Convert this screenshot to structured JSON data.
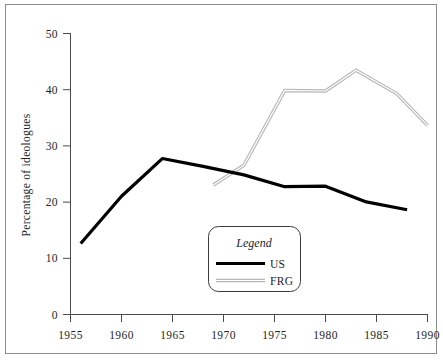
{
  "figure": {
    "border_color": "#8d8d8d",
    "background": "#ffffff"
  },
  "axes": {
    "y_axis_title": "Percentage of ideologues",
    "y_ticks": [
      "0",
      "10",
      "20",
      "30",
      "40",
      "50"
    ],
    "x_ticks": [
      "1955",
      "1960",
      "1965",
      "1970",
      "1975",
      "1980",
      "1985",
      "1990"
    ],
    "axis_color": "#4a4a4a"
  },
  "legend": {
    "title": "Legend",
    "entries": [
      {
        "label": "US",
        "color": "#000000",
        "style": "thick-solid"
      },
      {
        "label": "FRG",
        "color": "#b5b5b5",
        "style": "thin-double"
      }
    ]
  },
  "chart_data": {
    "type": "line",
    "title": "",
    "xlabel": "",
    "ylabel": "Percentage of ideologues",
    "xlim": [
      1955,
      1990
    ],
    "ylim": [
      0,
      50
    ],
    "xticks": [
      1955,
      1960,
      1965,
      1970,
      1975,
      1980,
      1985,
      1990
    ],
    "yticks": [
      0,
      10,
      20,
      30,
      40,
      50
    ],
    "grid": false,
    "legend_position": "inside-bottom-center",
    "series": [
      {
        "name": "US",
        "color": "#000000",
        "x": [
          1956,
          1960,
          1964,
          1968,
          1972,
          1976,
          1980,
          1984,
          1988
        ],
        "values": [
          12.6,
          21.0,
          27.7,
          26.3,
          24.8,
          22.7,
          22.8,
          20.0,
          18.6
        ]
      },
      {
        "name": "FRG",
        "color": "#b5b5b5",
        "x": [
          1969,
          1972,
          1976,
          1980,
          1983,
          1987,
          1990
        ],
        "values": [
          23.0,
          26.5,
          39.8,
          39.7,
          43.4,
          39.2,
          33.6
        ]
      }
    ]
  }
}
